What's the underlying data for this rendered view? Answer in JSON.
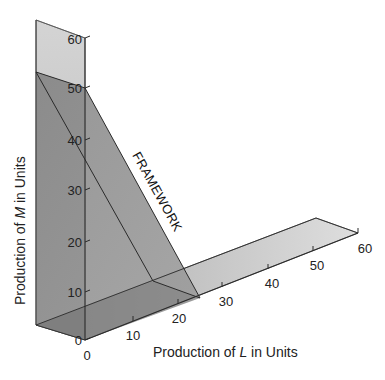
{
  "diagram": {
    "type": "3d-production-framework",
    "framework_label": "FRAMEWORK",
    "m_axis": {
      "title_prefix": "Production of ",
      "title_var": "M",
      "title_suffix": " in Units",
      "ticks": [
        "0",
        "10",
        "20",
        "30",
        "40",
        "50",
        "60"
      ]
    },
    "l_axis": {
      "title_prefix": "Production of ",
      "title_var": "L",
      "title_suffix": " in Units",
      "ticks": [
        "0",
        "10",
        "20",
        "30",
        "40",
        "50",
        "60"
      ]
    },
    "depth_zero_label": "0",
    "colors": {
      "back_plane": "#c9c9c9",
      "floor_plane": "#bdbdbd",
      "framework_plane": "#8f8f8f",
      "overlap_dark": "#7a7a7a",
      "lines": "#2a2a2a"
    }
  }
}
